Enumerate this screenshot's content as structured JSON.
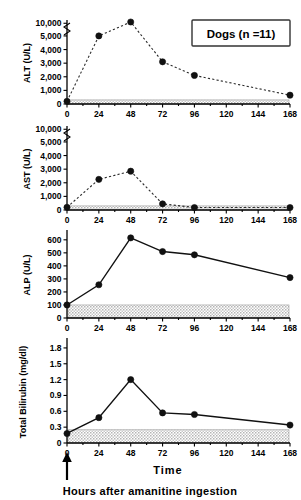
{
  "figure": {
    "legend_label": "Dogs (n =11)",
    "time_axis_title": "Time",
    "caption": "Hours after amanitine ingestion",
    "arrow_marker": "ingestion-time-arrow",
    "ingestion_time_hours": 0
  },
  "chart_data": [
    {
      "type": "line",
      "title": "",
      "ylabel": "ALT (U/L)",
      "xlabel": "Time",
      "x": [
        0,
        24,
        48,
        72,
        96,
        168
      ],
      "values": [
        200,
        5000,
        10500,
        3100,
        2100,
        650
      ],
      "ytick_labels": [
        "0",
        "1,000",
        "2,000",
        "3,000",
        "4,000",
        "5,000",
        "10,000"
      ],
      "ytick_values": [
        0,
        1000,
        2000,
        3000,
        4000,
        5000,
        10000
      ],
      "xtick_labels": [
        "0",
        "24",
        "48",
        "72",
        "96",
        "120",
        "144",
        "168"
      ],
      "xtick_values": [
        0,
        24,
        48,
        72,
        96,
        120,
        144,
        168
      ],
      "xlim": [
        0,
        168
      ],
      "axis_break": true,
      "axis_break_between": [
        5000,
        10000
      ],
      "reference_band": [
        0,
        300
      ],
      "line_style": "dashed",
      "grid": false,
      "legend": "Dogs (n =11)"
    },
    {
      "type": "line",
      "title": "",
      "ylabel": "AST (U/L)",
      "xlabel": "Time",
      "x": [
        0,
        24,
        48,
        72,
        96,
        168
      ],
      "values": [
        200,
        2250,
        2850,
        450,
        180,
        180
      ],
      "ytick_labels": [
        "0",
        "1,000",
        "2,000",
        "3,000",
        "4,000",
        "5,000",
        "10,000"
      ],
      "ytick_values": [
        0,
        1000,
        2000,
        3000,
        4000,
        5000,
        10000
      ],
      "xtick_labels": [
        "0",
        "24",
        "48",
        "72",
        "96",
        "120",
        "144",
        "168"
      ],
      "xtick_values": [
        0,
        24,
        48,
        72,
        96,
        120,
        144,
        168
      ],
      "xlim": [
        0,
        168
      ],
      "axis_break": true,
      "axis_break_between": [
        5000,
        10000
      ],
      "reference_band": [
        0,
        300
      ],
      "line_style": "dashed",
      "grid": false
    },
    {
      "type": "line",
      "title": "",
      "ylabel": "ALP (U/L)",
      "xlabel": "Time",
      "x": [
        0,
        24,
        48,
        72,
        96,
        168
      ],
      "values": [
        100,
        255,
        615,
        510,
        485,
        310
      ],
      "ytick_labels": [
        "0",
        "100",
        "200",
        "300",
        "400",
        "500",
        "600"
      ],
      "ytick_values": [
        0,
        100,
        200,
        300,
        400,
        500,
        600
      ],
      "xtick_labels": [
        "0",
        "24",
        "48",
        "72",
        "96",
        "120",
        "144",
        "168"
      ],
      "xtick_values": [
        0,
        24,
        48,
        72,
        96,
        120,
        144,
        168
      ],
      "xlim": [
        0,
        168
      ],
      "ylim": [
        0,
        660
      ],
      "axis_break": false,
      "reference_band": [
        0,
        100
      ],
      "line_style": "solid",
      "grid": false
    },
    {
      "type": "line",
      "title": "",
      "ylabel": "Total Bilirubin (mg/dl)",
      "xlabel": "Time",
      "x": [
        0,
        24,
        48,
        72,
        96,
        168
      ],
      "values": [
        0.18,
        0.48,
        1.2,
        0.57,
        0.54,
        0.34
      ],
      "ytick_labels": [
        "0",
        "0.3",
        "0.6",
        "0.9",
        "1.2",
        "1.5",
        "1.8"
      ],
      "ytick_values": [
        0,
        0.3,
        0.6,
        0.9,
        1.2,
        1.5,
        1.8
      ],
      "xtick_labels": [
        "0",
        "24",
        "48",
        "72",
        "96",
        "120",
        "144",
        "168"
      ],
      "xtick_values": [
        0,
        24,
        48,
        72,
        96,
        120,
        144,
        168
      ],
      "xlim": [
        0,
        168
      ],
      "ylim": [
        0,
        1.95
      ],
      "axis_break": false,
      "reference_band": [
        0,
        0.25
      ],
      "line_style": "solid",
      "grid": false
    }
  ]
}
